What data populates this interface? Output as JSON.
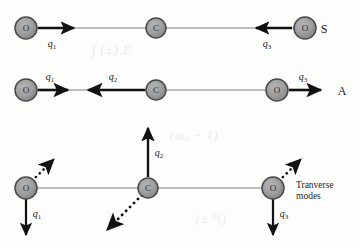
{
  "figure": {
    "background_color": "#fdfdfc",
    "atom_fill_color": "#9c9c9c",
    "atom_stroke_color": "#4a4a4a",
    "arrow_color": "#111111",
    "bond_color": "#6f6f6f",
    "text_color": "#1c1c1c"
  },
  "rows": [
    {
      "id": "symmetric-stretch",
      "mode_label": "S",
      "atoms": [
        {
          "id": "atom-o-left",
          "label": "O",
          "cx": 26,
          "cy": 28,
          "r": 11
        },
        {
          "id": "atom-c-center",
          "label": "C",
          "cx": 156,
          "cy": 28,
          "r": 10
        },
        {
          "id": "atom-o-right",
          "label": "O",
          "cx": 305,
          "cy": 28,
          "r": 11
        }
      ],
      "arrows": [
        {
          "id": "arrow-q1",
          "label": "q",
          "sub": "1",
          "direction": "right",
          "style": "solid",
          "x1": 38,
          "y1": 28,
          "x2": 78,
          "y2": 28,
          "label_x": 52,
          "label_y": 43
        },
        {
          "id": "arrow-q3",
          "label": "q",
          "sub": "3",
          "direction": "left",
          "style": "solid",
          "x1": 292,
          "y1": 28,
          "x2": 252,
          "y2": 28,
          "label_x": 267,
          "label_y": 43
        }
      ],
      "bond_line": {
        "x1": 26,
        "y1": 28,
        "x2": 305,
        "y2": 28
      },
      "mode_label_x": 324,
      "mode_label_y": 29
    },
    {
      "id": "antisymmetric-stretch",
      "mode_label": "A",
      "atoms": [
        {
          "id": "atom-o-left",
          "label": "O",
          "cx": 26,
          "cy": 90,
          "r": 11
        },
        {
          "id": "atom-c-center",
          "label": "C",
          "cx": 156,
          "cy": 90,
          "r": 10
        },
        {
          "id": "atom-o-right",
          "label": "O",
          "cx": 277,
          "cy": 90,
          "r": 11
        }
      ],
      "arrows": [
        {
          "id": "arrow-q1",
          "label": "q",
          "sub": "1",
          "direction": "right",
          "style": "solid",
          "x1": 38,
          "y1": 90,
          "x2": 72,
          "y2": 90,
          "label_x": 50,
          "label_y": 76
        },
        {
          "id": "arrow-q2",
          "label": "q",
          "sub": "2",
          "direction": "left",
          "style": "solid",
          "x1": 145,
          "y1": 90,
          "x2": 84,
          "y2": 90,
          "label_x": 113,
          "label_y": 76
        },
        {
          "id": "arrow-q3",
          "label": "q",
          "sub": "3",
          "direction": "right",
          "style": "solid",
          "x1": 289,
          "y1": 90,
          "x2": 325,
          "y2": 90,
          "label_x": 303,
          "label_y": 76
        }
      ],
      "bond_line": {
        "x1": 26,
        "y1": 90,
        "x2": 277,
        "y2": 90
      },
      "mode_label_x": 342,
      "mode_label_y": 91
    },
    {
      "id": "transverse-modes",
      "mode_label": "Tranverse modes",
      "atoms": [
        {
          "id": "atom-o-left",
          "label": "O",
          "cx": 26,
          "cy": 188,
          "r": 11
        },
        {
          "id": "atom-c-center",
          "label": "C",
          "cx": 148,
          "cy": 188,
          "r": 10
        },
        {
          "id": "atom-o-right",
          "label": "O",
          "cx": 273,
          "cy": 188,
          "r": 11
        }
      ],
      "arrows": [
        {
          "id": "arrow-q1",
          "label": "q",
          "sub": "1",
          "direction": "down",
          "style": "solid",
          "x1": 26,
          "y1": 199,
          "x2": 26,
          "y2": 239,
          "label_x": 37,
          "label_y": 213
        },
        {
          "id": "arrow-q2",
          "label": "q",
          "sub": "2",
          "direction": "up",
          "style": "solid",
          "x1": 148,
          "y1": 177,
          "x2": 148,
          "y2": 124,
          "label_x": 159,
          "label_y": 152
        },
        {
          "id": "arrow-q3",
          "label": "q",
          "sub": "3",
          "direction": "down",
          "style": "solid",
          "x1": 273,
          "y1": 199,
          "x2": 273,
          "y2": 239,
          "label_x": 284,
          "label_y": 213
        },
        {
          "id": "arrow-dotted-left",
          "label": "",
          "sub": "",
          "direction": "up-right",
          "style": "dotted",
          "x1": 32,
          "y1": 180,
          "x2": 56,
          "y2": 157,
          "label_x": 0,
          "label_y": 0
        },
        {
          "id": "arrow-dotted-center",
          "label": "",
          "sub": "",
          "direction": "down-left",
          "style": "dotted",
          "x1": 141,
          "y1": 196,
          "x2": 104,
          "y2": 233,
          "label_x": 0,
          "label_y": 0
        },
        {
          "id": "arrow-dotted-right",
          "label": "",
          "sub": "",
          "direction": "up-right",
          "style": "dotted",
          "x1": 279,
          "y1": 180,
          "x2": 303,
          "y2": 157,
          "label_x": 0,
          "label_y": 0
        }
      ],
      "bond_line": {
        "x1": 26,
        "y1": 188,
        "x2": 273,
        "y2": 188
      },
      "mode_label_x": 296,
      "mode_label_y": 180
    }
  ]
}
